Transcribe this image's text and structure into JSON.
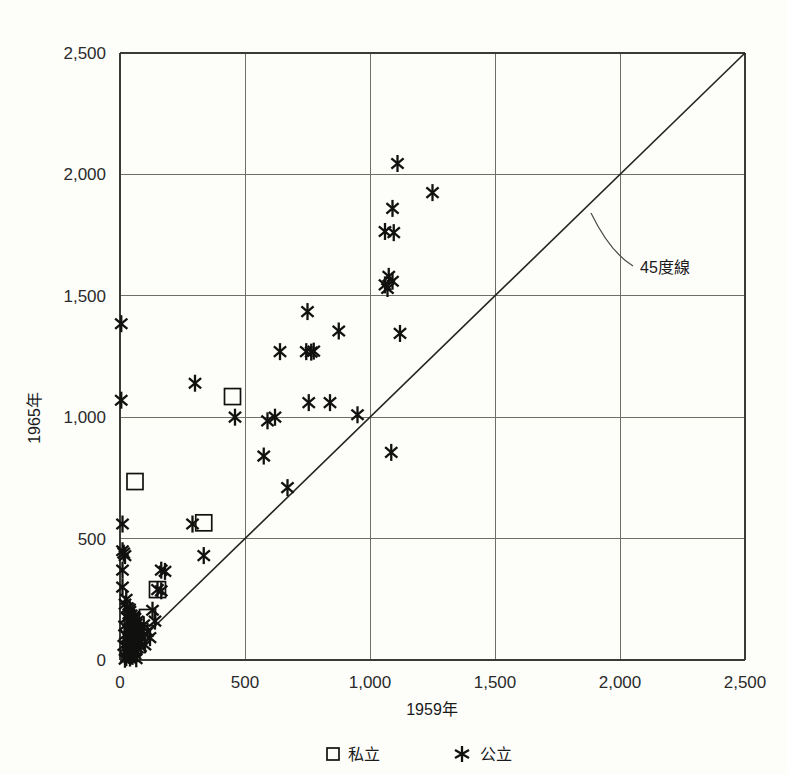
{
  "chart_data": {
    "type": "scatter",
    "title": "",
    "xlabel": "1959年",
    "ylabel": "1965年",
    "xlim": [
      0,
      2500
    ],
    "ylim": [
      0,
      2500
    ],
    "xticks": [
      0,
      500,
      1000,
      1500,
      2000,
      2500
    ],
    "yticks": [
      0,
      500,
      1000,
      1500,
      2000,
      2500
    ],
    "xticklabels": [
      "0",
      "500",
      "1,000",
      "1,500",
      "2,000",
      "2,500"
    ],
    "yticklabels": [
      "0",
      "500",
      "1,000",
      "1,500",
      "2,000",
      "2,500"
    ],
    "grid": true,
    "legend_position": "bottom",
    "annotations": [
      {
        "text": "45度線",
        "x": 1900,
        "y": 1620,
        "describes": "diagonal-reference-line"
      }
    ],
    "reference_line": {
      "name": "45度線",
      "from": [
        0,
        0
      ],
      "to": [
        2500,
        2500
      ],
      "slope": 1
    },
    "series": [
      {
        "name": "私立",
        "marker": "square",
        "marker_label": "□",
        "points": [
          [
            60,
            735
          ],
          [
            335,
            565
          ],
          [
            150,
            290
          ],
          [
            110,
            175
          ],
          [
            450,
            1085
          ]
        ]
      },
      {
        "name": "公立",
        "marker": "star",
        "marker_label": "✳",
        "points": [
          [
            1110,
            2045
          ],
          [
            1250,
            1925
          ],
          [
            1090,
            1860
          ],
          [
            1060,
            1765
          ],
          [
            1095,
            1760
          ],
          [
            1075,
            1580
          ],
          [
            1090,
            1560
          ],
          [
            1060,
            1545
          ],
          [
            1070,
            1530
          ],
          [
            5,
            1385
          ],
          [
            750,
            1435
          ],
          [
            875,
            1355
          ],
          [
            1120,
            1345
          ],
          [
            640,
            1270
          ],
          [
            745,
            1270
          ],
          [
            765,
            1268
          ],
          [
            775,
            1272
          ],
          [
            5,
            1070
          ],
          [
            300,
            1140
          ],
          [
            460,
            1000
          ],
          [
            590,
            985
          ],
          [
            620,
            1000
          ],
          [
            755,
            1060
          ],
          [
            840,
            1060
          ],
          [
            950,
            1010
          ],
          [
            575,
            840
          ],
          [
            1085,
            855
          ],
          [
            670,
            710
          ],
          [
            10,
            560
          ],
          [
            290,
            560
          ],
          [
            10,
            450
          ],
          [
            15,
            440
          ],
          [
            20,
            430
          ],
          [
            335,
            430
          ],
          [
            10,
            370
          ],
          [
            165,
            370
          ],
          [
            180,
            365
          ],
          [
            10,
            300
          ],
          [
            150,
            290
          ],
          [
            165,
            285
          ],
          [
            25,
            250
          ],
          [
            20,
            230
          ],
          [
            30,
            215
          ],
          [
            40,
            200
          ],
          [
            35,
            190
          ],
          [
            45,
            185
          ],
          [
            55,
            180
          ],
          [
            60,
            172
          ],
          [
            50,
            165
          ],
          [
            70,
            160
          ],
          [
            40,
            155
          ],
          [
            65,
            148
          ],
          [
            55,
            140
          ],
          [
            45,
            135
          ],
          [
            75,
            130
          ],
          [
            35,
            125
          ],
          [
            60,
            120
          ],
          [
            50,
            112
          ],
          [
            70,
            105
          ],
          [
            40,
            100
          ],
          [
            30,
            95
          ],
          [
            55,
            90
          ],
          [
            65,
            85
          ],
          [
            45,
            80
          ],
          [
            35,
            72
          ],
          [
            60,
            68
          ],
          [
            50,
            60
          ],
          [
            25,
            55
          ],
          [
            70,
            50
          ],
          [
            40,
            45
          ],
          [
            55,
            40
          ],
          [
            30,
            35
          ],
          [
            45,
            30
          ],
          [
            60,
            25
          ],
          [
            35,
            20
          ],
          [
            50,
            15
          ],
          [
            25,
            10
          ],
          [
            40,
            8
          ],
          [
            65,
            5
          ],
          [
            20,
            3
          ],
          [
            15,
            60
          ],
          [
            18,
            140
          ],
          [
            22,
            105
          ],
          [
            28,
            175
          ],
          [
            32,
            45
          ],
          [
            38,
            210
          ],
          [
            42,
            122
          ],
          [
            48,
            78
          ],
          [
            52,
            152
          ],
          [
            58,
            98
          ],
          [
            62,
            38
          ],
          [
            68,
            132
          ],
          [
            72,
            72
          ],
          [
            78,
            112
          ],
          [
            82,
            55
          ],
          [
            88,
            88
          ],
          [
            95,
            145
          ],
          [
            100,
            62
          ],
          [
            110,
            118
          ],
          [
            120,
            92
          ],
          [
            130,
            205
          ],
          [
            140,
            160
          ]
        ]
      }
    ]
  },
  "legend": {
    "items": [
      {
        "marker": "□",
        "label": "私立"
      },
      {
        "marker": "✳",
        "label": "公立"
      }
    ]
  }
}
